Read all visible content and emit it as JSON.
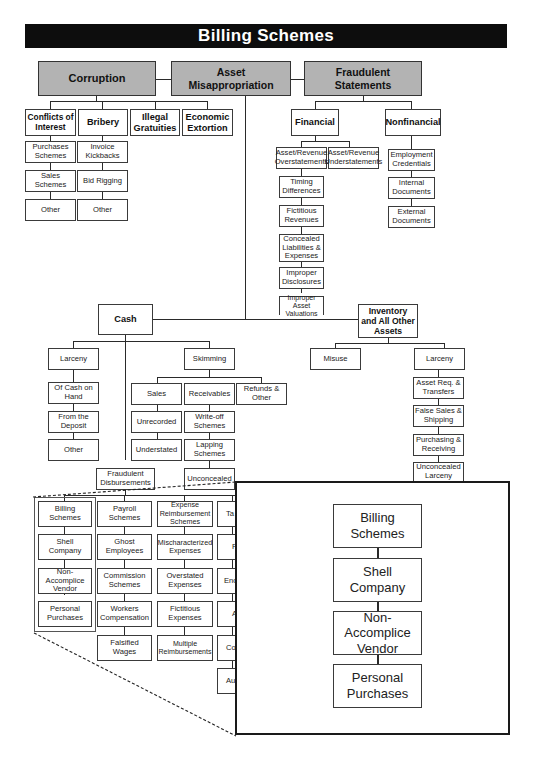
{
  "title": "Billing Schemes",
  "top_categories": {
    "corruption": "Corruption",
    "asset_misappropriation": "Asset\nMisappropriation",
    "fraudulent_statements": "Fraudulent\nStatements"
  },
  "corruption": {
    "conflicts_of_interest": "Conflicts of Interest",
    "bribery": "Bribery",
    "illegal_gratuities": "Illegal Gratuities",
    "economic_extortion": "Economic Extortion",
    "conflicts_children": [
      "Purchases Schemes",
      "Sales Schemes",
      "Other"
    ],
    "bribery_children": [
      "Invoice Kickbacks",
      "Bid Rigging",
      "Other"
    ]
  },
  "fraudulent_statements": {
    "financial": "Financial",
    "nonfinancial": "Nonfinancial",
    "financial_overstatements": "Asset/Revenue Overstatements",
    "financial_understatements": "Asset/Revenue Understatements",
    "overstatement_children": [
      "Timing Differences",
      "Fictitious Revenues",
      "Concealed Liabilities & Expenses",
      "Improper Disclosures",
      "Improper Asset Valuations"
    ],
    "nonfinancial_children": [
      "Employment Credentials",
      "Internal Documents",
      "External Documents"
    ]
  },
  "asset_misappropriation": {
    "cash": "Cash",
    "inventory": "Inventory and All Other Assets",
    "cash_larceny": "Larceny",
    "cash_larceny_children": [
      "Of Cash on Hand",
      "From the Deposit",
      "Other"
    ],
    "skimming": "Skimming",
    "skimming_children": [
      "Sales",
      "Receivables",
      "Refunds & Other"
    ],
    "sales_children": [
      "Unrecorded",
      "Understated"
    ],
    "receivables_children": [
      "Write-off Schemes",
      "Lapping Schemes",
      "Unconcealed"
    ],
    "inventory_misuse": "Misuse",
    "inventory_larceny": "Larceny",
    "inventory_larceny_children": [
      "Asset Req. & Transfers",
      "False Sales & Shipping",
      "Purchasing & Receiving",
      "Unconcealed Larceny"
    ],
    "fraudulent_disbursements": "Fraudulent Disbursements",
    "disbursement_columns": [
      {
        "head": "Billing Schemes",
        "children": [
          "Shell Company",
          "Non-Accomplice Vendor",
          "Personal Purchases"
        ]
      },
      {
        "head": "Payroll Schemes",
        "children": [
          "Ghost Employees",
          "Commission Schemes",
          "Workers Compensation",
          "Falsified Wages"
        ]
      },
      {
        "head": "Expense Reimbursement Schemes",
        "children": [
          "Mischaracterized Expenses",
          "Overstated Expenses",
          "Fictitious Expenses",
          "Multiple Reimbursements"
        ]
      },
      {
        "head": "Ta",
        "children": [
          "F",
          "End",
          "A",
          "Co",
          "Au"
        ]
      }
    ]
  },
  "zoom_panel": {
    "items": [
      "Billing Schemes",
      "Shell Company",
      "Non-Accomplice Vendor",
      "Personal Purchases"
    ]
  }
}
